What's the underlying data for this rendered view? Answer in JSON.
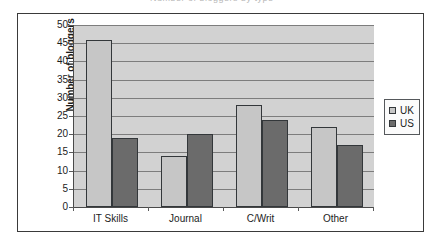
{
  "caption": {
    "text": "Number of bloggers by type"
  },
  "legend": {
    "position": "right",
    "entries": [
      {
        "label": "UK",
        "color": "#c6c6c6",
        "swatch": "legend-swatch-uk"
      },
      {
        "label": "US",
        "color": "#6b6b6b",
        "swatch": "legend-swatch-us"
      }
    ]
  },
  "chart_data": {
    "type": "bar",
    "title": "",
    "xlabel": "",
    "ylabel": "Number of bloggers",
    "categories": [
      "IT Skills",
      "Journal",
      "C/Writ",
      "Other"
    ],
    "series": [
      {
        "name": "UK",
        "color": "#c6c6c6",
        "values": [
          46,
          14,
          28,
          22
        ]
      },
      {
        "name": "US",
        "color": "#6b6b6b",
        "values": [
          19,
          20,
          24,
          17
        ]
      }
    ],
    "ylim": [
      0,
      50
    ],
    "ytick_step": 5,
    "yticks": [
      0,
      5,
      10,
      15,
      20,
      25,
      30,
      35,
      40,
      45,
      50
    ],
    "ytick_labels": [
      "0",
      "5",
      "10",
      "15",
      "20",
      "25",
      "30",
      "35",
      "40",
      "45",
      "50"
    ],
    "grid": true,
    "grid_axis": "y",
    "legend_position": "right",
    "plot_background": "#d2d2d2",
    "bar_border_color": "#33373a"
  }
}
